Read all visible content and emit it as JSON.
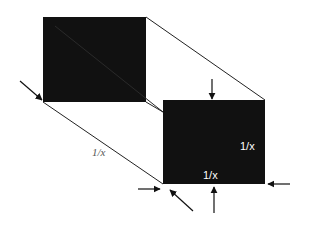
{
  "diagram": {
    "type": "prism-projection",
    "colors": {
      "face": "#111111",
      "line": "#222222",
      "label_outside": "#555555",
      "label_inside": "#ffffff"
    },
    "labels": {
      "length": "1/x",
      "height": "1/x",
      "width": "1/x"
    },
    "shapes": {
      "back_face": {
        "x": 43,
        "y": 17,
        "w": 103,
        "h": 85
      },
      "front_face": {
        "x": 163,
        "y": 100,
        "w": 102,
        "h": 84
      }
    },
    "arrows": [
      {
        "name": "left-diagonal-arrow",
        "from": [
          20,
          81
        ],
        "to": [
          43,
          101
        ]
      },
      {
        "name": "top-arrow",
        "from": [
          212,
          79
        ],
        "to": [
          212,
          99
        ]
      },
      {
        "name": "bottom-arrow",
        "from": [
          214,
          213
        ],
        "to": [
          214,
          187
        ]
      },
      {
        "name": "right-arrow",
        "from": [
          290,
          184
        ],
        "to": [
          268,
          184
        ]
      },
      {
        "name": "bottom-left-arrow",
        "from": [
          138,
          189
        ],
        "to": [
          160,
          189
        ]
      },
      {
        "name": "bottom-diagonal-arrow",
        "from": [
          193,
          211
        ],
        "to": [
          170,
          190
        ]
      }
    ]
  }
}
